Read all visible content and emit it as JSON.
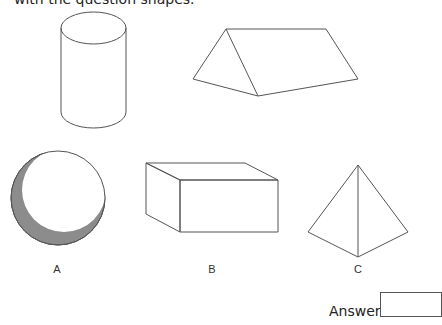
{
  "question": {
    "instruction_fragment": "with the question shapes."
  },
  "question_shapes": [
    {
      "name": "cylinder"
    },
    {
      "name": "triangular-prism"
    }
  ],
  "options": [
    {
      "label": "A",
      "shape": "sphere"
    },
    {
      "label": "B",
      "shape": "cuboid"
    },
    {
      "label": "C",
      "shape": "triangular-pyramid"
    }
  ],
  "answer": {
    "label": "Answer",
    "value": ""
  },
  "colors": {
    "stroke": "#555555",
    "shading": "#8c8c8c"
  }
}
